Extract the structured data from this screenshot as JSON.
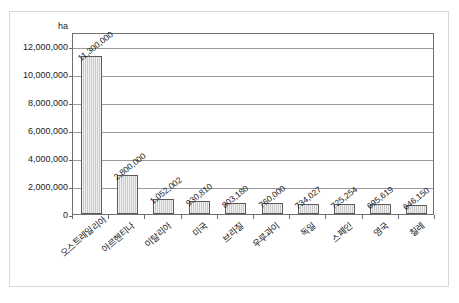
{
  "chart_data": {
    "type": "bar",
    "title": "",
    "subtitle": "",
    "xlabel": "",
    "ylabel": "ha",
    "unit_label": "ha",
    "ylim": [
      0,
      13000000
    ],
    "grid": true,
    "legend": "none",
    "orientation": "vertical",
    "tick_labels": [
      "0",
      "2,000,000",
      "4,000,000",
      "6,000,000",
      "8,000,000",
      "10,000,000",
      "12,000,000"
    ],
    "tick_values": [
      0,
      2000000,
      4000000,
      6000000,
      8000000,
      10000000,
      12000000
    ],
    "categories": [
      "오스트레일리아",
      "아르헨티나",
      "이탈리아",
      "미국",
      "브라질",
      "우루과이",
      "독일",
      "스페인",
      "영국",
      "칠레"
    ],
    "values": [
      11300000,
      2800000,
      1052002,
      930810,
      803180,
      760000,
      734027,
      725254,
      695619,
      646150
    ],
    "data_labels": [
      "11,300,000",
      "2,800,000",
      "1,052,002",
      "930,810",
      "803,180",
      "760,000",
      "734,027",
      "725,254",
      "695,619",
      "646,150"
    ],
    "colors": {
      "bar_fill": "#c9c9c9",
      "bar_stroke": "#5a5a5a",
      "gridline": "#9a9a9a",
      "axis": "#6f6f6f",
      "plot_background": "#ffffff",
      "frame": "#d8d8d8",
      "text": "#1a1a1a"
    }
  }
}
